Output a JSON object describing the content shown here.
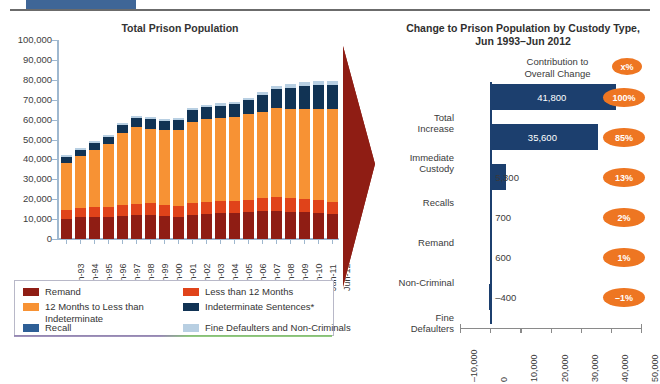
{
  "banner": {
    "red_strip_text": "",
    "blue_block": "blue-block"
  },
  "left_panel": {
    "title": "Total Prison Population",
    "legend": {
      "items": [
        {
          "label": "Remand",
          "color": "#8f1d14"
        },
        {
          "label": "Less than 12 Months",
          "color": "#e0431a"
        },
        {
          "label": "12 Months to Less than Indeterminate",
          "color": "#f79234"
        },
        {
          "label": "Indeterminate Sentences*",
          "color": "#113354"
        },
        {
          "label": "Recall",
          "color": "#2e5f96"
        },
        {
          "label": "Fine Defaulters and Non-Criminals",
          "color": "#b8cfe2"
        }
      ]
    }
  },
  "right_panel": {
    "title_line1": "Change to Prison Population by Custody Type,",
    "title_line2": "Jun 1993–Jun 2012",
    "contribution_caption_line1": "Contribution to",
    "contribution_caption_line2": "Overall Change",
    "contribution_badge_sample": "x%"
  },
  "chart_data": [
    {
      "type": "bar",
      "id": "total-prison-population",
      "title": "Total Prison Population",
      "stacked": true,
      "orientation": "vertical",
      "xlabel": "",
      "ylabel": "",
      "ylim": [
        0,
        100000
      ],
      "ytick_labels": [
        "100,000",
        "90,000",
        "80,000",
        "70,000",
        "60,000",
        "50,000",
        "40,000",
        "30,000",
        "20,000",
        "10,000",
        "0"
      ],
      "ytick_values": [
        100000,
        90000,
        80000,
        70000,
        60000,
        50000,
        40000,
        30000,
        20000,
        10000,
        0
      ],
      "grid": false,
      "legend_position": "below",
      "categories": [
        "Jun-93",
        "Jun-94",
        "Jun-95",
        "Jun-96",
        "Jun-97",
        "Jun-98",
        "Jun-99",
        "Jun-00",
        "Jun-01",
        "Jun-02",
        "Jun-03",
        "Jun-04",
        "Jun-05",
        "Jun-06",
        "Jun-07",
        "Jun-08",
        "Jun-09",
        "Jun-10",
        "Jun-11",
        "Jun-12"
      ],
      "series": [
        {
          "name": "Remand",
          "color": "#8f1d14",
          "values": [
            10300,
            11000,
            11200,
            11300,
            11600,
            12000,
            12200,
            11500,
            11200,
            12300,
            12700,
            13000,
            13200,
            13500,
            14100,
            14300,
            13800,
            13400,
            13100,
            12600
          ]
        },
        {
          "name": "Less than 12 Months",
          "color": "#e0431a",
          "values": [
            4300,
            4500,
            4700,
            5000,
            5300,
            5600,
            5700,
            5600,
            5500,
            5700,
            5900,
            6000,
            6000,
            6100,
            6400,
            6600,
            6600,
            6500,
            6300,
            6100
          ]
        },
        {
          "name": "12 Months to Less than Indeterminate",
          "color": "#f79234",
          "values": [
            23500,
            26000,
            29000,
            31500,
            36500,
            38500,
            37500,
            37500,
            38000,
            41000,
            41500,
            41800,
            42000,
            43000,
            43500,
            45000,
            45000,
            45500,
            46000,
            46500
          ]
        },
        {
          "name": "Indeterminate Sentences*",
          "color": "#113354",
          "values": [
            3000,
            3200,
            3400,
            3700,
            4000,
            4500,
            4700,
            4900,
            5200,
            5600,
            6000,
            6300,
            6600,
            7200,
            8400,
            9500,
            10700,
            11600,
            12100,
            12400
          ]
        },
        {
          "name": "Recall",
          "color": "#2e5f96",
          "values": [
            0,
            0,
            0,
            0,
            0,
            0,
            0,
            0,
            0,
            0,
            0,
            0,
            0,
            0,
            0,
            0,
            0,
            0,
            0,
            0
          ]
        },
        {
          "name": "Fine Defaulters and Non-Criminals",
          "color": "#b8cfe2",
          "values": [
            900,
            900,
            900,
            900,
            900,
            1000,
            1000,
            1000,
            1000,
            1100,
            1100,
            1200,
            1200,
            1300,
            1400,
            1500,
            1600,
            1700,
            1800,
            1900
          ]
        }
      ]
    },
    {
      "type": "bar",
      "id": "change-by-custody-type",
      "title": "Change to Prison Population by Custody Type, Jun 1993–Jun 2012",
      "orientation": "horizontal",
      "bar_color": "#1c3f6e",
      "xlim": [
        -10000,
        50000
      ],
      "xtick_labels": [
        "–10,000",
        "0",
        "10,000",
        "20,000",
        "30,000",
        "40,000",
        "50,000"
      ],
      "xtick_values": [
        -10000,
        0,
        10000,
        20000,
        30000,
        40000,
        50000
      ],
      "grid": false,
      "categories": [
        "Total Increase",
        "Immediate Custody",
        "Recalls",
        "Remand",
        "Non-Criminal",
        "Fine Defaulters"
      ],
      "category_lines": [
        [
          "Total",
          "Increase"
        ],
        [
          "Immediate",
          "Custody"
        ],
        [
          "Recalls"
        ],
        [
          "Remand"
        ],
        [
          "Non-Criminal"
        ],
        [
          "Fine",
          "Defaulters"
        ]
      ],
      "values": [
        41800,
        35600,
        5300,
        700,
        600,
        -400
      ],
      "value_labels": [
        "41,800",
        "35,600",
        "5,300",
        "700",
        "600",
        "–400"
      ],
      "contribution_labels": [
        "100%",
        "85%",
        "13%",
        "2%",
        "1%",
        "–1%"
      ],
      "contribution_color": "#ee7622"
    }
  ]
}
